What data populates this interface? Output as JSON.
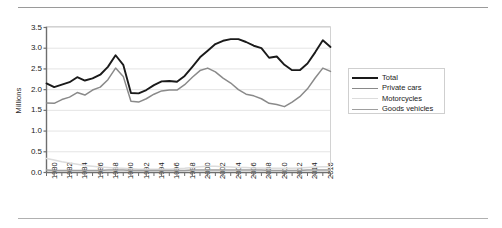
{
  "chart_data": {
    "type": "line",
    "title": "",
    "xlabel": "",
    "ylabel": "Millions",
    "ylim": [
      0.0,
      3.5
    ],
    "xlim": [
      1980,
      2017
    ],
    "grid": true,
    "legend_position": "right",
    "ytick_labels": [
      "0.0",
      "0.5",
      "1.0",
      "1.5",
      "2.0",
      "2.5",
      "3.0",
      "3.5"
    ],
    "ytick_values": [
      0.0,
      0.5,
      1.0,
      1.5,
      2.0,
      2.5,
      3.0,
      3.5
    ],
    "xtick_labels": [
      "1980",
      "1982",
      "1984",
      "1986",
      "1988",
      "1990",
      "1992",
      "1994",
      "1996",
      "1998",
      "2000",
      "2002",
      "2004",
      "2006",
      "2008",
      "2010",
      "2012",
      "2014",
      "2016"
    ],
    "x": [
      1980,
      1981,
      1982,
      1983,
      1984,
      1985,
      1986,
      1987,
      1988,
      1989,
      1990,
      1991,
      1992,
      1993,
      1994,
      1995,
      1996,
      1997,
      1998,
      1999,
      2000,
      2001,
      2002,
      2003,
      2004,
      2005,
      2006,
      2007,
      2008,
      2009,
      2010,
      2011,
      2012,
      2013,
      2014,
      2015,
      2016,
      2017
    ],
    "series": [
      {
        "name": "Total",
        "color": "#1a1a1a",
        "values": [
          2.15,
          2.06,
          2.12,
          2.18,
          2.3,
          2.22,
          2.27,
          2.36,
          2.55,
          2.83,
          2.6,
          1.92,
          1.91,
          1.99,
          2.11,
          2.2,
          2.21,
          2.19,
          2.33,
          2.55,
          2.78,
          2.94,
          3.1,
          3.18,
          3.22,
          3.22,
          3.15,
          3.06,
          3.0,
          2.77,
          2.8,
          2.6,
          2.47,
          2.47,
          2.63,
          2.9,
          3.19,
          3.03
        ]
      },
      {
        "name": "Private cars",
        "color": "#8a8a8a",
        "values": [
          1.68,
          1.67,
          1.76,
          1.82,
          1.93,
          1.87,
          1.99,
          2.06,
          2.24,
          2.52,
          2.32,
          1.72,
          1.7,
          1.78,
          1.89,
          1.97,
          1.99,
          1.99,
          2.12,
          2.3,
          2.46,
          2.52,
          2.43,
          2.28,
          2.16,
          2.0,
          1.89,
          1.85,
          1.78,
          1.67,
          1.64,
          1.59,
          1.7,
          1.83,
          2.02,
          2.28,
          2.52,
          2.44
        ]
      },
      {
        "name": "Motorcycles",
        "color": "#dcdcdc",
        "values": [
          0.34,
          0.3,
          0.26,
          0.23,
          0.2,
          0.17,
          0.15,
          0.13,
          0.12,
          0.11,
          0.1,
          0.09,
          0.08,
          0.08,
          0.08,
          0.08,
          0.08,
          0.09,
          0.1,
          0.12,
          0.14,
          0.15,
          0.15,
          0.14,
          0.13,
          0.12,
          0.12,
          0.11,
          0.11,
          0.1,
          0.1,
          0.1,
          0.1,
          0.11,
          0.12,
          0.13,
          0.14,
          0.14
        ]
      },
      {
        "name": "Goods vehicles",
        "color": "#9f9f9f",
        "values": [
          0.06,
          0.05,
          0.05,
          0.05,
          0.05,
          0.05,
          0.05,
          0.05,
          0.06,
          0.06,
          0.06,
          0.05,
          0.05,
          0.05,
          0.05,
          0.05,
          0.05,
          0.05,
          0.05,
          0.06,
          0.06,
          0.06,
          0.06,
          0.06,
          0.06,
          0.06,
          0.06,
          0.06,
          0.06,
          0.05,
          0.05,
          0.05,
          0.05,
          0.05,
          0.06,
          0.06,
          0.06,
          0.06
        ]
      }
    ]
  }
}
